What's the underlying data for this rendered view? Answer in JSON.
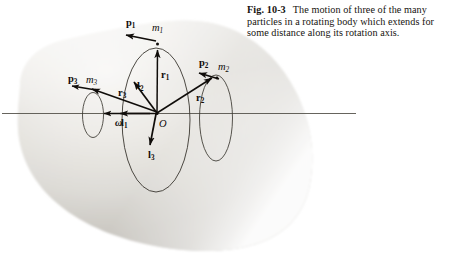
{
  "caption": {
    "figure_number": "Fig. 10-3",
    "text": "The motion of three of the many particles in a rotating body which extends for some distance along its rotation axis."
  },
  "figure": {
    "origin_label": "O",
    "axis_label": "rotation axis",
    "angular_velocity": {
      "symbol": "ω",
      "sub": ""
    },
    "colors": {
      "ink": "#100d0a",
      "body_light": "#f0efec",
      "body_mid": "#cfcdc8",
      "body_dark": "#a7a49d",
      "background": "#ffffff",
      "orbit_line": "#3a3730",
      "axis_line": "#55524b"
    },
    "particles": [
      {
        "id": "particle-1",
        "mass_label": "m",
        "mass_sub": "1",
        "momentum_label": "p",
        "momentum_sub": "1",
        "radius_label": "r",
        "radius_sub": "1",
        "angular_momentum_label": "l",
        "angular_momentum_sub": "2"
      },
      {
        "id": "particle-2",
        "mass_label": "m",
        "mass_sub": "2",
        "momentum_label": "p",
        "momentum_sub": "2",
        "radius_label": "r",
        "radius_sub": "2",
        "angular_momentum_label": "l",
        "angular_momentum_sub": "3"
      },
      {
        "id": "particle-3",
        "mass_label": "m",
        "mass_sub": "3",
        "momentum_label": "p",
        "momentum_sub": "3",
        "radius_label": "r",
        "radius_sub": "3",
        "angular_momentum_label": "l",
        "angular_momentum_sub": "1"
      }
    ],
    "labels": {
      "p1": "p",
      "p1_sub": "1",
      "p2": "p",
      "p2_sub": "2",
      "p3": "p",
      "p3_sub": "3",
      "m1": "m",
      "m1_sub": "1",
      "m2": "m",
      "m2_sub": "2",
      "m3": "m",
      "m3_sub": "3",
      "r1": "r",
      "r1_sub": "1",
      "r2": "r",
      "r2_sub": "2",
      "r3": "r",
      "r3_sub": "3",
      "l1": "l",
      "l1_sub": "1",
      "l2": "l",
      "l2_sub": "2",
      "l3": "l",
      "l3_sub": "3",
      "omega": "ω",
      "origin": "O"
    }
  }
}
